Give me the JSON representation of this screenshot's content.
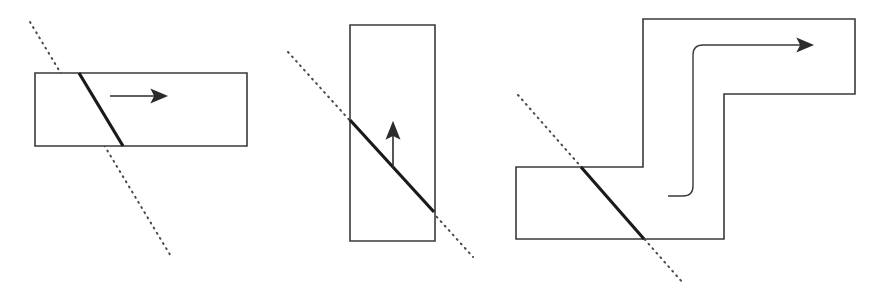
{
  "canvas": {
    "width": 882,
    "height": 294,
    "background": "#ffffff",
    "title": "Three shapes crossed by dotted cutting lines"
  },
  "style": {
    "outline_color": "#3a3a3a",
    "outline_width": 1.6,
    "cut_color": "#1a1a1a",
    "cut_width": 3.2,
    "dotted_color": "#4a4a4a",
    "dotted_width": 2,
    "dotted_dash": "1 5",
    "arrow_color": "#2b2b2b",
    "arrow_width": 1.6,
    "inner_path_color": "#3a3a3a",
    "inner_path_width": 1.4
  },
  "figures": [
    {
      "id": "figure-1",
      "name": "horizontal-rectangle",
      "shape_type": "rectangle",
      "outline_points": "35,73 247,73 247,146 35,146",
      "cut_segment": {
        "x1": 79,
        "y1": 73,
        "x2": 123,
        "y2": 146
      },
      "dotted_line": {
        "x1": 30,
        "y1": 22,
        "x2": 172,
        "y2": 258
      },
      "arrow": {
        "direction": "right",
        "shaft": {
          "x1": 110,
          "y1": 96,
          "x2": 160,
          "y2": 96
        },
        "head": "166,96 152,90 155,96 152,102"
      }
    },
    {
      "id": "figure-2",
      "name": "vertical-rectangle",
      "shape_type": "rectangle",
      "outline_points": "350,25 435,25 435,241 350,241",
      "cut_segment": {
        "x1": 350,
        "y1": 120,
        "x2": 434,
        "y2": 212
      },
      "dotted_line": {
        "x1": 288,
        "y1": 52,
        "x2": 473,
        "y2": 257
      },
      "arrow": {
        "direction": "up",
        "shaft": {
          "x1": 393,
          "y1": 168,
          "x2": 393,
          "y2": 130
        },
        "head": "393,123 387,138 393,135 399,138"
      }
    },
    {
      "id": "figure-3",
      "name": "z-shaped-polygon",
      "shape_type": "polygon",
      "outline_points": "643,19 855,19 855,94 724,94 724,239 516,239 516,167 643,167",
      "cut_segment": {
        "x1": 581,
        "y1": 167,
        "x2": 644,
        "y2": 239
      },
      "dotted_line": {
        "x1": 518,
        "y1": 95,
        "x2": 683,
        "y2": 283
      },
      "inner_path": "M 668,196 L 683,196 Q 693,196 693,186 L 693,55 Q 693,45 703,45 L 806,45",
      "arrow": {
        "direction": "right",
        "shaft": {
          "x1": 703,
          "y1": 45,
          "x2": 806,
          "y2": 45
        },
        "head": "812,45 798,39 801,45 798,51"
      }
    }
  ]
}
